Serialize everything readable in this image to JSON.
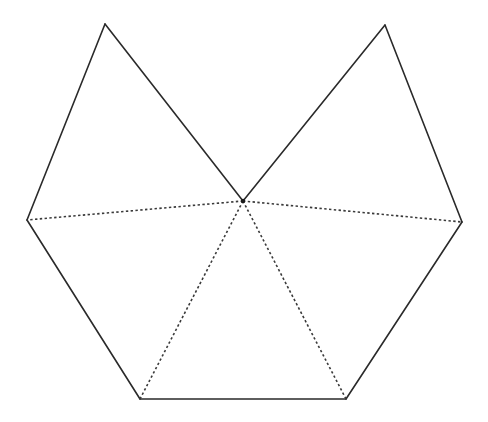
{
  "diagram": {
    "type": "polygon-net",
    "colors": {
      "background": "#ffffff",
      "solid_stroke": "#2a2a2a",
      "dashed_stroke": "#3a3a3a",
      "center_dot": "#1a1a1a"
    },
    "vertices": {
      "top_left": [
        105,
        24
      ],
      "top_right": [
        385,
        25
      ],
      "center": [
        243,
        201
      ],
      "left": [
        27,
        220
      ],
      "right": [
        462,
        222
      ],
      "bottom_left": [
        140,
        399
      ],
      "bottom_right": [
        346,
        399
      ]
    },
    "solid_edges": [
      [
        "top_left",
        "left"
      ],
      [
        "top_left",
        "center"
      ],
      [
        "center",
        "top_right"
      ],
      [
        "top_right",
        "right"
      ],
      [
        "right",
        "bottom_right"
      ],
      [
        "bottom_right",
        "bottom_left"
      ],
      [
        "bottom_left",
        "left"
      ]
    ],
    "dashed_edges": [
      [
        "center",
        "left"
      ],
      [
        "center",
        "right"
      ],
      [
        "center",
        "bottom_left"
      ],
      [
        "center",
        "bottom_right"
      ]
    ]
  }
}
